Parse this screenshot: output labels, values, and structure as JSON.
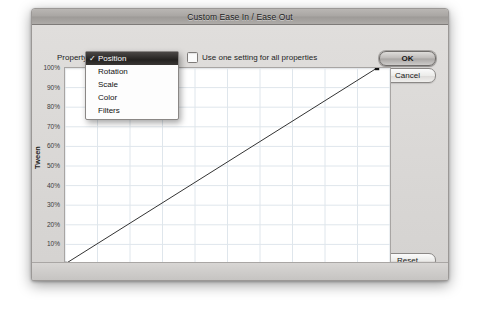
{
  "window": {
    "title": "Custom Ease In / Ease Out"
  },
  "toolbar": {
    "property_label": "Property",
    "selected_property": "Position",
    "use_one_setting_label": "Use one setting for all properties",
    "use_one_setting_checked": false,
    "property_options": [
      {
        "label": "Position",
        "checked": true
      },
      {
        "label": "Rotation",
        "checked": false
      },
      {
        "label": "Scale",
        "checked": false
      },
      {
        "label": "Color",
        "checked": false
      },
      {
        "label": "Filters",
        "checked": false
      }
    ]
  },
  "buttons": {
    "ok": "OK",
    "cancel": "Cancel",
    "reset": "Reset"
  },
  "transport": {
    "stop_icon": "stop-icon",
    "play_icon": "play-icon"
  },
  "status": {
    "frame_label": "Frame",
    "frame_value": "---",
    "comma": ",",
    "percent_value": "---",
    "percent_symbol": "%"
  },
  "chart_data": {
    "type": "line",
    "title": "",
    "xlabel": "Frames",
    "ylabel": "Tween",
    "xlim": [
      0,
      50
    ],
    "ylim": [
      0,
      100
    ],
    "xticks": [
      5,
      10,
      15,
      20,
      25,
      30,
      35,
      40,
      45
    ],
    "yticks": [
      10,
      20,
      30,
      40,
      50,
      60,
      70,
      80,
      90,
      100
    ],
    "ytick_labels": [
      "10%",
      "20%",
      "30%",
      "40%",
      "50%",
      "60%",
      "70%",
      "80%",
      "90%",
      "100%"
    ],
    "grid": true,
    "grid_color": "#dfe6ec",
    "line_color": "#333333",
    "series": [
      {
        "name": "Ease curve",
        "x": [
          0,
          48
        ],
        "values": [
          0,
          100
        ]
      }
    ],
    "control_points": [
      {
        "frame": 0,
        "tween": 0
      },
      {
        "frame": 48,
        "tween": 100
      }
    ],
    "legend": "none"
  }
}
